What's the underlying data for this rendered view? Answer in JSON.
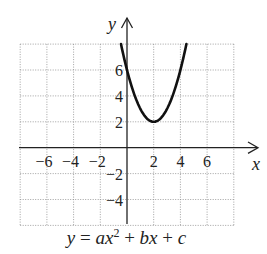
{
  "chart_data": {
    "type": "line",
    "title": "",
    "caption": "y = ax^2 + bx + c",
    "xlabel": "x",
    "ylabel": "y",
    "xlim": [
      -8,
      8
    ],
    "ylim": [
      -6,
      8
    ],
    "grid": true,
    "grid_step": 2,
    "x_tick_labels": [
      "-6",
      "-4",
      "-2",
      "2",
      "4",
      "6"
    ],
    "x_ticks": [
      -6,
      -4,
      -2,
      2,
      4,
      6
    ],
    "y_tick_labels": [
      "6",
      "4",
      "2",
      "-2",
      "-4"
    ],
    "y_ticks": [
      6,
      4,
      2,
      -2,
      -4
    ],
    "series": [
      {
        "name": "parabola",
        "equation": "y = x^2 - 4x + 6",
        "vertex": [
          2,
          2
        ],
        "y_intercept": 6,
        "x": [
          -0.45,
          0,
          0.5,
          1,
          1.5,
          2,
          2.5,
          3,
          3.5,
          4,
          4.45
        ],
        "y": [
          8.0,
          6,
          4.25,
          3,
          2.25,
          2,
          2.25,
          3,
          4.25,
          6,
          8.0
        ]
      }
    ]
  },
  "labels": {
    "x_axis": "x",
    "y_axis": "y",
    "caption_y": "y",
    "caption_eq": "=",
    "caption_a": "ax",
    "caption_exp": "2",
    "caption_plus1": "+",
    "caption_b": "bx",
    "caption_plus2": "+",
    "caption_c": "c"
  }
}
